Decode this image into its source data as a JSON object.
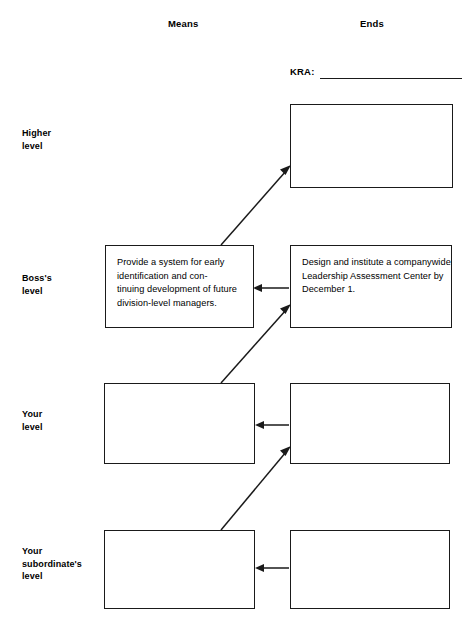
{
  "headers": {
    "means": "Means",
    "ends": "Ends"
  },
  "kra": {
    "label": "KRA:",
    "value": ""
  },
  "row_labels": {
    "higher": "Higher\nlevel",
    "boss": "Boss's\nlevel",
    "your": "Your\nlevel",
    "subordinate": "Your\nsubordinate's\nlevel"
  },
  "boxes": {
    "means_boss": "Provide a system for early identification and con-\ntinuing development of future division-level managers.",
    "means_your": "",
    "means_subordinate": "",
    "ends_higher": "",
    "ends_boss": "Design and institute a companywide Leadership Assessment Center by December 1.",
    "ends_your": "",
    "ends_subordinate": ""
  },
  "colors": {
    "ink": "#1a1a1a",
    "background": "#ffffff"
  },
  "connectors": [
    {
      "name": "means-boss-to-ends-higher",
      "type": "diagonal-arrow",
      "from": "means-boss-top-left",
      "to": "ends-higher-bottom-left"
    },
    {
      "name": "ends-boss-to-means-boss",
      "type": "horizontal-arrow",
      "from": "ends-boss-left",
      "to": "means-boss-right"
    },
    {
      "name": "means-your-to-ends-boss",
      "type": "diagonal-arrow",
      "from": "means-your-top-left",
      "to": "ends-boss-bottom-left"
    },
    {
      "name": "ends-your-to-means-your",
      "type": "horizontal-arrow",
      "from": "ends-your-left",
      "to": "means-your-right"
    },
    {
      "name": "means-subordinate-to-ends-your",
      "type": "diagonal-arrow",
      "from": "means-subordinate-top-left",
      "to": "ends-your-bottom-left"
    },
    {
      "name": "ends-subordinate-to-means-subordinate",
      "type": "horizontal-arrow",
      "from": "ends-subordinate-left",
      "to": "means-subordinate-right"
    }
  ]
}
